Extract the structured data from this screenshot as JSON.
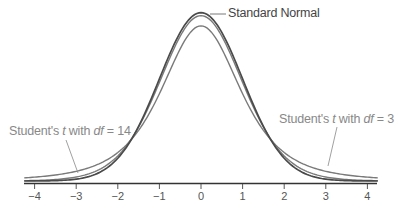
{
  "chart_data": {
    "type": "line",
    "title": "",
    "xlabel": "",
    "ylabel": "",
    "xlim": [
      -4.25,
      4.25
    ],
    "x_ticks": [
      -4,
      -3,
      -2,
      -1,
      0,
      1,
      2,
      3,
      4
    ],
    "x_tick_labels": [
      "−4",
      "−3",
      "−2",
      "−1",
      "0",
      "1",
      "2",
      "3",
      "4"
    ],
    "grid": false,
    "legend": "inline annotations",
    "series": [
      {
        "name": "Standard Normal",
        "distribution": "normal",
        "peak_density": 0.399,
        "color": "#4a4a4a"
      },
      {
        "name": "Student's t with df = 14",
        "distribution": "t",
        "df": 14,
        "peak_density": 0.392,
        "color": "#7a7a7a"
      },
      {
        "name": "Student's t with df = 3",
        "distribution": "t",
        "df": 3,
        "peak_density": 0.368,
        "color": "#7a7a7a"
      }
    ],
    "annotations": [
      {
        "text": "Standard Normal",
        "points_to": "Standard Normal peak"
      },
      {
        "text_prefix": "Student's ",
        "text_t": "t",
        "text_mid": " with ",
        "text_df": "df",
        "text_suffix": " = 14",
        "points_to": "t df=14 left tail"
      },
      {
        "text_prefix": "Student's ",
        "text_t": "t",
        "text_mid": " with ",
        "text_df": "df",
        "text_suffix": " = 3",
        "points_to": "t df=3 right tail"
      }
    ]
  },
  "labels": {
    "normal": "Standard Normal",
    "t14_prefix": "Student's ",
    "t14_t": "t",
    "t14_mid": " with ",
    "t14_df": "df",
    "t14_suffix": " = 14",
    "t3_prefix": "Student's ",
    "t3_t": "t",
    "t3_mid": " with ",
    "t3_df": "df",
    "t3_suffix": " = 3"
  }
}
